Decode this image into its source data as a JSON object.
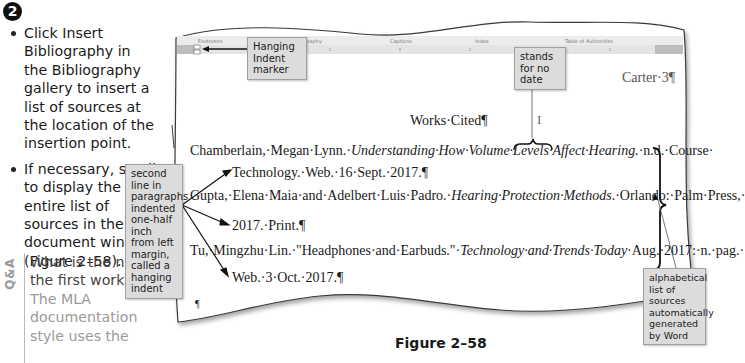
{
  "step": {
    "number": "2",
    "bullets": [
      "Click Insert Bibliography in the Bibliography gallery to insert a list of sources at the location of the insertion point.",
      "If necessary, scroll to display the entire list of sources in the document window (Figure 2–58)."
    ]
  },
  "qa": {
    "tag": "Q&A",
    "question": "What is the n.d. in the first work?",
    "answer": "The MLA documentation style uses the"
  },
  "ribbon": {
    "tabs": [
      "Footnotes",
      "& Bibliography",
      "Captions",
      "Index",
      "Table of Authorities"
    ]
  },
  "document": {
    "header": "Carter·3¶",
    "title": "Works·Cited¶",
    "entries": [
      {
        "line1_prefix": "Chamberlain,·Megan·Lynn.·",
        "line1_italic": "Understanding·How·Volume·Levels·Affect·Hearing.",
        "line1_suffix": "·n.d.·Course·",
        "line2": "Technology.·Web.·16·Sept.·2017.¶"
      },
      {
        "line1_prefix": "Gupta,·Elena·Maia·and·Adelbert·Luis·Padro.·",
        "line1_italic": "Hearing·Protection·Methods",
        "line1_suffix": ".·Orlando:·Palm·Press,·",
        "line2": "2017.·Print.¶"
      },
      {
        "line1_prefix": "Tu,·Mingzhu·Lin.·\"Headphones·and·Earbuds.\"·",
        "line1_italic": "Technology·and·Trends·Today",
        "line1_suffix": "·Aug.·2017:·n.·pag.·",
        "line2": "Web.·3·Oct.·2017.¶"
      }
    ],
    "end_mark": "¶"
  },
  "callouts": {
    "hanging_indent_marker": "Hanging Indent marker",
    "no_date": "stands for no date",
    "second_line": "second line in paragraphs indented one-half inch from left margin, called a hanging indent",
    "alphabetical": "alphabetical list of sources automatically generated by Word"
  },
  "figure": {
    "caption": "Figure 2–58"
  }
}
